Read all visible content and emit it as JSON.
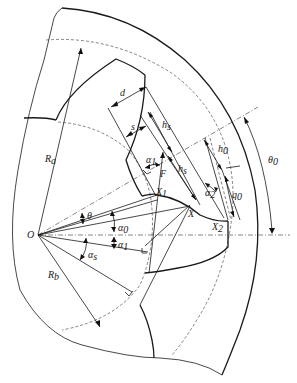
{
  "figure": {
    "labels": {
      "origin": "O",
      "addendum_radius": {
        "base": "R",
        "sub": "a"
      },
      "base_radius": {
        "base": "R",
        "sub": "b"
      },
      "tooth_width": "d",
      "arc_s": "s",
      "h_s_upper": {
        "base": "h",
        "sub": "s"
      },
      "h_s_lower": {
        "base": "h",
        "sub": "s"
      },
      "h_0": {
        "base": "h",
        "sub": "0"
      },
      "q_0": {
        "base": "q",
        "sub": "0"
      },
      "theta_0": {
        "base": "θ",
        "sub": "0"
      },
      "theta": "θ",
      "point_F": "F",
      "point_X": "X",
      "point_X1": {
        "base": "X",
        "sub": "1"
      },
      "point_X2": {
        "base": "X",
        "sub": "2"
      },
      "alpha_1_upper": {
        "base": "α",
        "sub": "1"
      },
      "alpha_2": {
        "base": "α",
        "sub": "2"
      },
      "alpha_0": {
        "base": "α",
        "sub": "0"
      },
      "alpha_1_lower": {
        "base": "α",
        "sub": "1"
      },
      "alpha_s": {
        "base": "α",
        "sub": "s"
      }
    }
  }
}
